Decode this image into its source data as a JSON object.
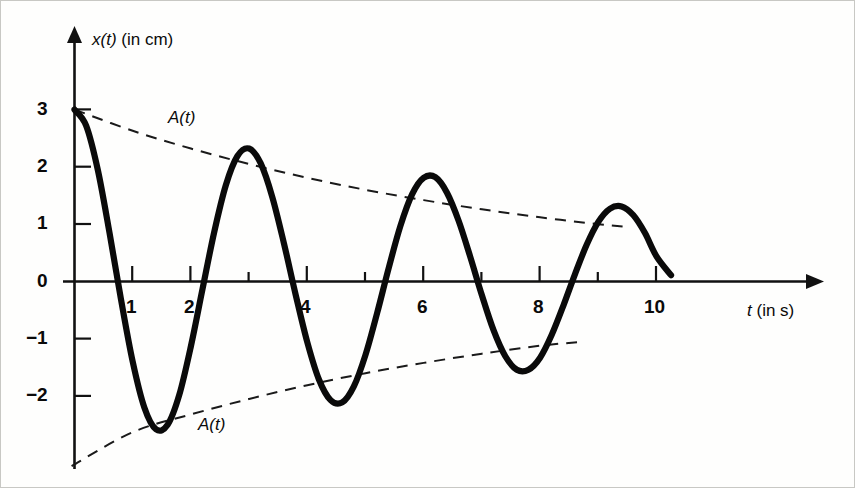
{
  "figure": {
    "caption_hidden": "",
    "background_color": "#fdfdfc",
    "ink_color": "#0a0a0a"
  },
  "axes": {
    "y_axis_label_var": "x(t)",
    "y_axis_label_unit": "(in cm)",
    "x_axis_label_var": "t",
    "x_axis_label_unit": "(in s)",
    "x_ticks": [
      {
        "value": 1,
        "label": "1"
      },
      {
        "value": 2,
        "label": "2"
      },
      {
        "value": 3,
        "label": ""
      },
      {
        "value": 4,
        "label": "4"
      },
      {
        "value": 5,
        "label": ""
      },
      {
        "value": 6,
        "label": "6"
      },
      {
        "value": 7,
        "label": ""
      },
      {
        "value": 8,
        "label": "8"
      },
      {
        "value": 9,
        "label": ""
      },
      {
        "value": 10,
        "label": "10"
      }
    ],
    "y_ticks": [
      {
        "value": 3,
        "label": "3"
      },
      {
        "value": 2,
        "label": "2"
      },
      {
        "value": 1,
        "label": "1"
      },
      {
        "value": 0,
        "label": "0"
      },
      {
        "value": -1,
        "label": "−1"
      },
      {
        "value": -2,
        "label": "−2"
      }
    ]
  },
  "annotations": {
    "envelope_upper_label": "A(t)",
    "envelope_lower_label": "A(t)"
  },
  "chart_data": {
    "type": "line",
    "title": "",
    "xlabel": "t (in s)",
    "ylabel": "x(t) (in cm)",
    "xlim": [
      0,
      12.4
    ],
    "ylim": [
      -3.4,
      3.4
    ],
    "grid": false,
    "legend": "none",
    "series": [
      {
        "name": "x(t)",
        "style": "solid-thick",
        "description": "damped harmonic oscillation starting at 3 cm, period about 2.4 s, decaying exponentially",
        "model": {
          "amplitude0": 3.0,
          "period": 2.4,
          "decay_time_constant": 7.6,
          "phase": 0.0,
          "t_start": 0.0,
          "t_end": 10.25
        },
        "x": [
          0.0,
          0.2,
          0.4,
          0.6,
          0.8,
          1.0,
          1.2,
          1.4,
          1.6,
          1.8,
          2.0,
          2.2,
          2.4,
          2.6,
          2.8,
          3.0,
          3.2,
          3.4,
          3.6,
          3.8,
          4.0,
          4.2,
          4.4,
          4.6,
          4.8,
          5.0,
          5.2,
          5.4,
          5.6,
          5.8,
          6.0,
          6.2,
          6.4,
          6.6,
          6.8,
          7.0,
          7.2,
          7.4,
          7.6,
          7.8,
          8.0,
          8.2,
          8.4,
          8.6,
          8.8,
          9.0,
          9.2,
          9.4,
          9.6,
          9.8,
          10.0,
          10.25
        ],
        "y": [
          3.0,
          2.72,
          1.95,
          0.86,
          -0.32,
          -1.4,
          -2.2,
          -2.58,
          -2.5,
          -1.98,
          -1.13,
          -0.13,
          0.86,
          1.68,
          2.19,
          2.32,
          2.06,
          1.47,
          0.66,
          -0.23,
          -1.06,
          -1.71,
          -2.07,
          -2.11,
          -1.83,
          -1.28,
          -0.55,
          0.24,
          0.97,
          1.52,
          1.81,
          1.82,
          1.55,
          1.06,
          0.43,
          -0.24,
          -0.85,
          -1.3,
          -1.54,
          -1.54,
          -1.33,
          -0.93,
          -0.42,
          0.13,
          0.64,
          1.04,
          1.27,
          1.31,
          1.16,
          0.85,
          0.44,
          0.11
        ]
      },
      {
        "name": "A(t) upper envelope",
        "style": "dashed",
        "description": "upper exponential decay envelope",
        "x": [
          0.0,
          1.0,
          2.0,
          3.0,
          4.0,
          5.0,
          6.0,
          7.0,
          8.0,
          9.0,
          9.5
        ],
        "y": [
          3.0,
          2.63,
          2.32,
          2.05,
          1.81,
          1.6,
          1.42,
          1.26,
          1.12,
          1.0,
          0.95
        ]
      },
      {
        "name": "A(t) lower envelope",
        "style": "dashed",
        "description": "lower exponential decay envelope (negative mirror)",
        "x": [
          -0.05,
          1.0,
          2.0,
          3.0,
          4.0,
          5.0,
          6.0,
          7.0,
          8.0,
          8.65
        ],
        "y": [
          -3.22,
          -2.63,
          -2.32,
          -2.05,
          -1.81,
          -1.6,
          -1.42,
          -1.26,
          -1.12,
          -1.06
        ]
      }
    ],
    "annotations": [
      {
        "text": "A(t)",
        "x": 2.0,
        "y": 2.65,
        "role": "upper-envelope-label"
      },
      {
        "text": "A(t)",
        "x": 2.45,
        "y": -2.55,
        "role": "lower-envelope-label"
      }
    ]
  }
}
